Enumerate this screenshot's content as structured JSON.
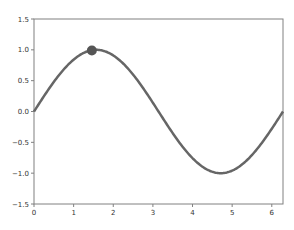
{
  "chart_data": {
    "type": "line",
    "title": "",
    "xlabel": "",
    "ylabel": "",
    "xlim": [
      0,
      6.283
    ],
    "ylim": [
      -1.5,
      1.5
    ],
    "grid": false,
    "legend": null,
    "xticks": [
      "0",
      "1",
      "2",
      "3",
      "4",
      "5",
      "6"
    ],
    "yticks": [
      "-1.5",
      "-1.0",
      "-0.5",
      "0.0",
      "0.5",
      "1.0",
      "1.5"
    ],
    "series": [
      {
        "name": "sin(x)",
        "function": "sin",
        "x": [
          0,
          0.5,
          1.0,
          1.5708,
          2.0,
          2.5,
          3.1416,
          3.5,
          4.0,
          4.7124,
          5.0,
          5.5,
          6.2832
        ],
        "values": [
          0,
          0.479,
          0.841,
          1.0,
          0.909,
          0.598,
          0,
          -0.351,
          -0.757,
          -1.0,
          -0.959,
          -0.706,
          0
        ],
        "color": "#666666"
      }
    ],
    "annotations": [
      {
        "type": "marker",
        "x": 1.46,
        "y": 0.99,
        "color": "#555555"
      }
    ]
  },
  "colors": {
    "line": "#666666",
    "marker": "#555555",
    "axes": "#808080",
    "text": "#333333"
  }
}
